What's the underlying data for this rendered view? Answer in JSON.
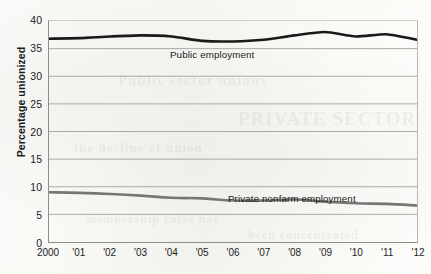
{
  "chart_data": {
    "type": "line",
    "title": "",
    "subtitle": "",
    "xlabel": "",
    "ylabel": "Percentage unionized",
    "x": [
      2000,
      2001,
      2002,
      2003,
      2004,
      2005,
      2006,
      2007,
      2008,
      2009,
      2010,
      2011,
      2012
    ],
    "xtick_labels": [
      "2000",
      "'01",
      "'02",
      "'03",
      "'04",
      "'05",
      "'06",
      "'07",
      "'08",
      "'09",
      "'10",
      "'11",
      "'12"
    ],
    "ytick_labels": [
      "0",
      "5",
      "10",
      "15",
      "20",
      "25",
      "30",
      "35",
      "40"
    ],
    "yticks": [
      0,
      5,
      10,
      15,
      20,
      25,
      30,
      35,
      40
    ],
    "ylim": [
      0,
      40
    ],
    "xlim": [
      2000,
      2012
    ],
    "grid": "horizontal",
    "legend_position": "inline-annotation",
    "series": [
      {
        "name": "Public employment",
        "color": "#1a1a1a",
        "width": 2.6,
        "values": [
          36.8,
          36.9,
          37.2,
          37.4,
          37.2,
          36.4,
          36.3,
          36.6,
          37.4,
          38.0,
          37.2,
          37.6,
          36.6
        ]
      },
      {
        "name": "Private nonfarm employment",
        "color": "#767672",
        "width": 2.6,
        "values": [
          9.0,
          8.9,
          8.7,
          8.4,
          8.0,
          7.9,
          7.5,
          7.5,
          7.7,
          7.3,
          7.0,
          6.9,
          6.6
        ]
      }
    ],
    "annotations": [
      {
        "name": "public-employment-label",
        "text": "Public employment"
      },
      {
        "name": "private-nonfarm-label",
        "text": "Private nonfarm employment"
      }
    ]
  },
  "ghost_text": {
    "line1": "Public sector unions",
    "line2": "PRIVATE SECTOR",
    "line3": "the decline of union",
    "line4": "membership rates has",
    "line5": "been concentrated"
  }
}
